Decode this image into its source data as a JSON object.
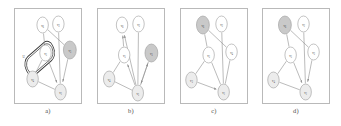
{
  "figure": {
    "title": "",
    "panel_count": 4,
    "node_ids": [
      "v1",
      "v2",
      "v3",
      "v4",
      "v5",
      "v6"
    ],
    "colors": {
      "frame": "#b9b9b9",
      "node_stroke": "#9a9a9a",
      "node_fill_plain": "#ffffff",
      "node_fill_light": "#ececec",
      "node_fill_shaded": "#c9c9c9",
      "edge": "#8d8d8d",
      "cluster_stroke": "#3c3c3c",
      "text": "#3a3a3a"
    }
  },
  "panels": [
    {
      "key": "a",
      "caption": "a)",
      "cluster_label": "U",
      "has_cluster": true,
      "nodes": [
        {
          "id": "v6",
          "label": "v",
          "sub": "6",
          "x": 40,
          "y": 17,
          "r": 8,
          "shade": "plain"
        },
        {
          "id": "v2",
          "label": "v",
          "sub": "2",
          "x": 62,
          "y": 16,
          "r": 8,
          "shade": "plain"
        },
        {
          "id": "v3",
          "label": "v",
          "sub": "3",
          "x": 78,
          "y": 42,
          "r": 9,
          "shade": "shaded"
        },
        {
          "id": "v5",
          "label": "v",
          "sub": "5",
          "x": 44,
          "y": 45,
          "r": 8,
          "shade": "plain"
        },
        {
          "id": "v4",
          "label": "v",
          "sub": "4",
          "x": 26,
          "y": 71,
          "r": 8,
          "shade": "light"
        },
        {
          "id": "v1",
          "label": "v",
          "sub": "1",
          "x": 65,
          "y": 84,
          "r": 8,
          "shade": "light"
        }
      ],
      "edges": [
        {
          "from": "v6",
          "to": "v5",
          "arrow": false
        },
        {
          "from": "v2",
          "to": "v1",
          "arrow": false
        },
        {
          "from": "v6",
          "to": "v3",
          "arrow": false
        },
        {
          "from": "v3",
          "to": "v1",
          "arrow": true
        },
        {
          "from": "v5",
          "to": "v1",
          "arrow": true
        },
        {
          "from": "v4",
          "to": "v1",
          "arrow": false
        },
        {
          "from": "v5",
          "to": "v4",
          "arrow": false
        }
      ]
    },
    {
      "key": "b",
      "caption": "b)",
      "cluster_label": "",
      "has_cluster": false,
      "nodes": [
        {
          "id": "v6",
          "label": "v",
          "sub": "6",
          "x": 35,
          "y": 17,
          "r": 8,
          "shade": "plain"
        },
        {
          "id": "v2",
          "label": "v",
          "sub": "2",
          "x": 58,
          "y": 16,
          "r": 8,
          "shade": "plain"
        },
        {
          "id": "v3",
          "label": "v",
          "sub": "3",
          "x": 76,
          "y": 45,
          "r": 9,
          "shade": "shaded"
        },
        {
          "id": "v5",
          "label": "v",
          "sub": "5",
          "x": 38,
          "y": 47,
          "r": 8,
          "shade": "plain"
        },
        {
          "id": "v4",
          "label": "v",
          "sub": "4",
          "x": 17,
          "y": 71,
          "r": 8,
          "shade": "light"
        },
        {
          "id": "v1",
          "label": "v",
          "sub": "1",
          "x": 57,
          "y": 85,
          "r": 8,
          "shade": "light"
        }
      ],
      "edges": [
        {
          "from": "v5",
          "to": "v6",
          "arrow": true
        },
        {
          "from": "v1",
          "to": "v6",
          "arrow": true
        },
        {
          "from": "v2",
          "to": "v1",
          "arrow": false
        },
        {
          "from": "v1",
          "to": "v5",
          "arrow": true
        },
        {
          "from": "v4",
          "to": "v5",
          "arrow": false
        },
        {
          "from": "v4",
          "to": "v1",
          "arrow": false
        },
        {
          "from": "v1",
          "to": "v3",
          "arrow": true
        },
        {
          "from": "v3",
          "to": "v1",
          "arrow": true
        }
      ]
    },
    {
      "key": "c",
      "caption": "c)",
      "cluster_label": "",
      "has_cluster": false,
      "nodes": [
        {
          "id": "v6",
          "label": "v",
          "sub": "6",
          "x": 32,
          "y": 17,
          "r": 9,
          "shade": "shaded"
        },
        {
          "id": "v2",
          "label": "v",
          "sub": "2",
          "x": 58,
          "y": 16,
          "r": 8,
          "shade": "plain"
        },
        {
          "id": "v4",
          "label": "v",
          "sub": "4",
          "x": 72,
          "y": 44,
          "r": 8,
          "shade": "plain"
        },
        {
          "id": "v5",
          "label": "v",
          "sub": "5",
          "x": 40,
          "y": 47,
          "r": 8,
          "shade": "plain"
        },
        {
          "id": "v3",
          "label": "v",
          "sub": "3",
          "x": 16,
          "y": 72,
          "r": 8,
          "shade": "light"
        },
        {
          "id": "v1",
          "label": "v",
          "sub": "1",
          "x": 61,
          "y": 84,
          "r": 8,
          "shade": "light"
        }
      ],
      "edges": [
        {
          "from": "v6",
          "to": "v5",
          "arrow": false
        },
        {
          "from": "v6",
          "to": "v4",
          "arrow": false
        },
        {
          "from": "v2",
          "to": "v1",
          "arrow": false
        },
        {
          "from": "v4",
          "to": "v1",
          "arrow": false
        },
        {
          "from": "v5",
          "to": "v1",
          "arrow": false
        },
        {
          "from": "v5",
          "to": "v3",
          "arrow": false
        },
        {
          "from": "v3",
          "to": "v1",
          "arrow": true
        }
      ]
    },
    {
      "key": "d",
      "caption": "d)",
      "cluster_label": "",
      "has_cluster": false,
      "nodes": [
        {
          "id": "v6",
          "label": "v",
          "sub": "6",
          "x": 32,
          "y": 17,
          "r": 9,
          "shade": "shaded"
        },
        {
          "id": "v2",
          "label": "v",
          "sub": "2",
          "x": 58,
          "y": 16,
          "r": 8,
          "shade": "plain"
        },
        {
          "id": "v3",
          "label": "v",
          "sub": "3",
          "x": 72,
          "y": 44,
          "r": 8,
          "shade": "plain"
        },
        {
          "id": "v5",
          "label": "v",
          "sub": "5",
          "x": 40,
          "y": 47,
          "r": 8,
          "shade": "plain"
        },
        {
          "id": "v4",
          "label": "v",
          "sub": "4",
          "x": 16,
          "y": 72,
          "r": 8,
          "shade": "light"
        },
        {
          "id": "v1",
          "label": "v",
          "sub": "1",
          "x": 61,
          "y": 84,
          "r": 8,
          "shade": "light"
        }
      ],
      "edges": [
        {
          "from": "v6",
          "to": "v5",
          "arrow": false
        },
        {
          "from": "v6",
          "to": "v3",
          "arrow": false
        },
        {
          "from": "v2",
          "to": "v1",
          "arrow": false
        },
        {
          "from": "v3",
          "to": "v1",
          "arrow": true
        },
        {
          "from": "v5",
          "to": "v1",
          "arrow": true
        },
        {
          "from": "v5",
          "to": "v4",
          "arrow": false
        },
        {
          "from": "v4",
          "to": "v1",
          "arrow": false
        }
      ]
    }
  ]
}
